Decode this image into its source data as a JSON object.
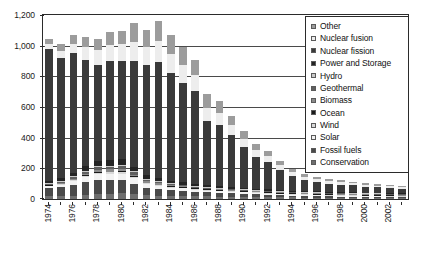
{
  "chart_data": {
    "type": "bar",
    "stacked": true,
    "title": "",
    "xlabel": "",
    "ylabel": "",
    "ylim": [
      0,
      1200
    ],
    "ytick_step": 200,
    "ytick_labels": [
      "0",
      "200",
      "400",
      "600",
      "800",
      "1,000",
      "1,200"
    ],
    "grid": true,
    "legend_position": "inside-top-right",
    "categories": [
      "1974",
      "1975",
      "1976",
      "1977",
      "1978",
      "1979",
      "1980",
      "1981",
      "1982",
      "1983",
      "1984",
      "1985",
      "1986",
      "1987",
      "1988",
      "1989",
      "1990",
      "1991",
      "1992",
      "1993",
      "1994",
      "1995",
      "1996",
      "1997",
      "1998",
      "1999",
      "2000",
      "2001",
      "2002",
      "2003"
    ],
    "xtick_labels": [
      "1974",
      "",
      "1976",
      "",
      "1978",
      "",
      "1980",
      "",
      "1982",
      "",
      "1984",
      "",
      "1986",
      "",
      "1988",
      "",
      "1990",
      "",
      "1992",
      "",
      "1994",
      "",
      "1996",
      "",
      "1998",
      "",
      "2000",
      "",
      "2002",
      ""
    ],
    "series": [
      {
        "name": "Conservation",
        "color": "#6e6e6e",
        "values": [
          18,
          17,
          22,
          26,
          30,
          32,
          36,
          30,
          24,
          22,
          20,
          20,
          18,
          17,
          16,
          15,
          14,
          13,
          12,
          11,
          10,
          9,
          9,
          8,
          8,
          7,
          7,
          6,
          6,
          5
        ]
      },
      {
        "name": "Fossil fuels",
        "color": "#4a4a4a",
        "values": [
          55,
          60,
          72,
          85,
          96,
          92,
          88,
          70,
          48,
          42,
          38,
          34,
          30,
          26,
          24,
          22,
          20,
          18,
          16,
          14,
          12,
          11,
          10,
          9,
          8,
          8,
          7,
          7,
          6,
          6
        ]
      },
      {
        "name": "Solar",
        "color": "#f2f2f2",
        "values": [
          10,
          16,
          22,
          30,
          36,
          38,
          40,
          34,
          24,
          20,
          17,
          15,
          13,
          12,
          11,
          10,
          9,
          8,
          8,
          7,
          7,
          6,
          6,
          5,
          5,
          5,
          4,
          4,
          4,
          3
        ]
      },
      {
        "name": "Wind",
        "color": "#d9d9d9",
        "values": [
          2,
          4,
          6,
          9,
          11,
          12,
          13,
          10,
          7,
          6,
          5,
          4,
          4,
          3,
          3,
          3,
          3,
          2,
          2,
          2,
          2,
          2,
          2,
          2,
          2,
          2,
          1,
          1,
          1,
          1
        ]
      },
      {
        "name": "Ocean",
        "color": "#1a1a1a",
        "values": [
          1,
          2,
          3,
          4,
          5,
          5,
          5,
          4,
          3,
          2,
          2,
          2,
          1,
          1,
          1,
          1,
          1,
          1,
          1,
          1,
          1,
          1,
          1,
          1,
          1,
          1,
          1,
          1,
          1,
          1
        ]
      },
      {
        "name": "Biomass",
        "color": "#8a8a8a",
        "values": [
          3,
          5,
          8,
          11,
          13,
          14,
          15,
          12,
          9,
          8,
          7,
          6,
          5,
          5,
          4,
          4,
          4,
          3,
          3,
          3,
          3,
          2,
          2,
          2,
          2,
          2,
          2,
          2,
          2,
          2
        ]
      },
      {
        "name": "Geothermal",
        "color": "#5f5f5f",
        "values": [
          5,
          8,
          11,
          14,
          16,
          17,
          18,
          15,
          11,
          9,
          8,
          7,
          6,
          5,
          5,
          4,
          4,
          4,
          3,
          3,
          3,
          3,
          2,
          2,
          2,
          2,
          2,
          2,
          2,
          2
        ]
      },
      {
        "name": "Hydro",
        "color": "#c9c9c9",
        "values": [
          2,
          3,
          4,
          5,
          6,
          6,
          6,
          5,
          4,
          3,
          3,
          2,
          2,
          2,
          2,
          2,
          2,
          1,
          1,
          1,
          1,
          1,
          1,
          1,
          1,
          1,
          1,
          1,
          1,
          1
        ]
      },
      {
        "name": "Power and Storage",
        "color": "#242424",
        "values": [
          14,
          18,
          24,
          30,
          34,
          36,
          38,
          32,
          24,
          20,
          18,
          16,
          14,
          12,
          11,
          10,
          9,
          8,
          8,
          7,
          7,
          6,
          6,
          5,
          5,
          5,
          4,
          4,
          4,
          4
        ]
      },
      {
        "name": "Nuclear fission",
        "color": "#3a3a3a",
        "values": [
          863,
          786,
          778,
          696,
          626,
          648,
          640,
          686,
          720,
          758,
          702,
          650,
          606,
          420,
          402,
          338,
          268,
          208,
          178,
          132,
          96,
          72,
          62,
          54,
          48,
          44,
          40,
          36,
          32,
          30
        ]
      },
      {
        "name": "Nuclear fusion",
        "color": "#ededed",
        "values": [
          30,
          44,
          60,
          80,
          96,
          106,
          114,
          128,
          120,
          136,
          126,
          116,
          104,
          88,
          78,
          66,
          54,
          44,
          38,
          30,
          24,
          20,
          18,
          16,
          15,
          14,
          13,
          12,
          11,
          10
        ]
      },
      {
        "name": "Other",
        "color": "#9c9c9c",
        "values": [
          36,
          48,
          58,
          68,
          78,
          82,
          86,
          120,
          108,
          132,
          124,
          114,
          102,
          88,
          76,
          64,
          52,
          42,
          36,
          28,
          22,
          18,
          16,
          14,
          13,
          12,
          11,
          10,
          9,
          8
        ]
      }
    ]
  },
  "legend": {
    "items": [
      {
        "label": "Other",
        "color": "#9c9c9c"
      },
      {
        "label": "Nuclear fusion",
        "color": "#ededed"
      },
      {
        "label": "Nuclear fission",
        "color": "#3a3a3a"
      },
      {
        "label": "Power and Storage",
        "color": "#242424"
      },
      {
        "label": "Hydro",
        "color": "#c9c9c9"
      },
      {
        "label": "Geothermal",
        "color": "#5f5f5f"
      },
      {
        "label": "Biomass",
        "color": "#8a8a8a"
      },
      {
        "label": "Ocean",
        "color": "#1a1a1a"
      },
      {
        "label": "Wind",
        "color": "#d9d9d9"
      },
      {
        "label": "Solar",
        "color": "#f2f2f2"
      },
      {
        "label": "Fossil fuels",
        "color": "#4a4a4a"
      },
      {
        "label": "Conservation",
        "color": "#6e6e6e"
      }
    ]
  }
}
